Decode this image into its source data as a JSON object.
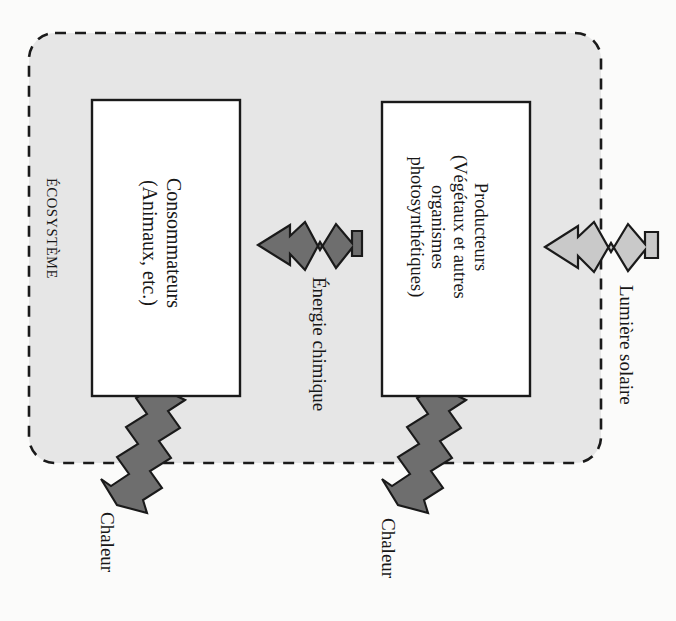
{
  "diagram": {
    "language": "fr",
    "orientation": "rotated-90-clockwise",
    "boundary_label": "ÉCOSYSTÈME",
    "colors": {
      "page_background": "#fbfbfa",
      "ecosystem_fill": "#e6e6e6",
      "ecosystem_border": "#1a1a1a",
      "box_fill": "#ffffff",
      "box_border": "#1a1a1a",
      "arrow_chemical": "#6e6e6e",
      "arrow_light": "#c9c9c9",
      "arrow_heat": "#6e6e6e",
      "arrow_outline": "#1a1a1a",
      "text": "#171717"
    },
    "boxes": [
      {
        "id": "consommateurs",
        "lines": [
          "Consommateurs",
          "(Animaux, etc.)"
        ]
      },
      {
        "id": "producteurs",
        "lines": [
          "Producteurs",
          "(Végétaux et autres",
          "organismes",
          "photosynthétiques)"
        ]
      }
    ],
    "arrows": [
      {
        "id": "lumiere-solaire",
        "label": "Lumière solaire",
        "style": "zigzag",
        "fill": "#c9c9c9",
        "direction": "into-ecosystem-toward-producteurs"
      },
      {
        "id": "energie-chimique",
        "label": "Énergie chimique",
        "style": "zigzag",
        "fill": "#6e6e6e",
        "direction": "producteurs-to-consommateurs"
      },
      {
        "id": "chaleur-producteurs",
        "label": "Chaleur",
        "style": "zigzag-diagonal",
        "fill": "#6e6e6e",
        "direction": "out-of-ecosystem"
      },
      {
        "id": "chaleur-consommateurs",
        "label": "Chaleur",
        "style": "zigzag-diagonal",
        "fill": "#6e6e6e",
        "direction": "out-of-ecosystem"
      }
    ]
  }
}
